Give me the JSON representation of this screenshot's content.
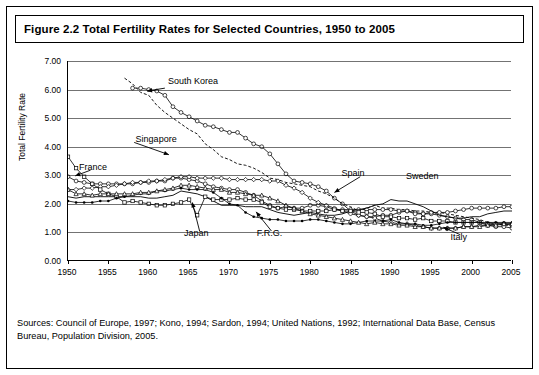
{
  "title": "Figure 2.2 Total Fertility Rates for Selected Countries, 1950 to 2005",
  "sources": "Sources: Council of Europe, 1997; Kono, 1994; Sardon, 1994; United Nations, 1992; International Data Base, Census Bureau, Population Division, 2005.",
  "chart_data": {
    "type": "line",
    "title": "Figure 2.2 Total Fertility Rates for Selected Countries, 1950 to 2005",
    "xlabel": "",
    "ylabel": "Total Fertility Rate",
    "xlim": [
      1950,
      2005
    ],
    "ylim": [
      0,
      7
    ],
    "grid": true,
    "legend_position": "inline-annotations",
    "yticks": [
      "0.00",
      "1.00",
      "2.00",
      "3.00",
      "4.00",
      "5.00",
      "6.00",
      "7.00"
    ],
    "ytick_values": [
      0,
      1,
      2,
      3,
      4,
      5,
      6,
      7
    ],
    "xticks": [
      "1950",
      "1955",
      "1960",
      "1965",
      "1970",
      "1975",
      "1980",
      "1985",
      "1990",
      "1995",
      "2000",
      "2005"
    ],
    "xtick_values": [
      1950,
      1955,
      1960,
      1965,
      1970,
      1975,
      1980,
      1985,
      1990,
      1995,
      2000,
      2005
    ],
    "annotations": [
      {
        "text": "South Korea",
        "x": 1962.5,
        "y": 6.25
      },
      {
        "text": "Singapore",
        "x": 1958.5,
        "y": 4.25
      },
      {
        "text": "France",
        "x": 1951.5,
        "y": 3.25
      },
      {
        "text": "Spain",
        "x": 1984.0,
        "y": 3.05
      },
      {
        "text": "Sweden",
        "x": 1992.0,
        "y": 2.95
      },
      {
        "text": "Japan",
        "x": 1964.5,
        "y": 0.95
      },
      {
        "text": "F.R.G.",
        "x": 1973.5,
        "y": 0.95
      },
      {
        "text": "Italy",
        "x": 1997.5,
        "y": 0.8
      }
    ],
    "series": [
      {
        "name": "South Korea",
        "x": [
          1958,
          1959,
          1960,
          1961,
          1962,
          1963,
          1964,
          1965,
          1966,
          1967,
          1968,
          1969,
          1970,
          1971,
          1972,
          1973,
          1974,
          1975,
          1976,
          1977,
          1978,
          1979,
          1980,
          1981,
          1982,
          1983,
          1984,
          1985,
          1986,
          1987,
          1988,
          1989,
          1990,
          1991,
          1992,
          1993,
          1994,
          1995,
          1996,
          1997,
          1998,
          1999,
          2000,
          2001,
          2002,
          2003,
          2004,
          2005
        ],
        "values": [
          6.05,
          6.05,
          6.0,
          5.95,
          5.8,
          5.4,
          5.2,
          5.05,
          4.9,
          4.75,
          4.7,
          4.6,
          4.5,
          4.5,
          4.3,
          4.1,
          4.0,
          3.75,
          3.4,
          3.05,
          2.8,
          2.75,
          2.7,
          2.6,
          2.45,
          2.2,
          2.0,
          1.75,
          1.6,
          1.55,
          1.55,
          1.6,
          1.6,
          1.7,
          1.75,
          1.7,
          1.65,
          1.65,
          1.6,
          1.55,
          1.5,
          1.45,
          1.45,
          1.35,
          1.25,
          1.2,
          1.2,
          1.15
        ]
      },
      {
        "name": "Singapore",
        "x": [
          1957,
          1958,
          1959,
          1960,
          1961,
          1962,
          1963,
          1964,
          1965,
          1966,
          1967,
          1968,
          1969,
          1970,
          1971,
          1972,
          1973,
          1974,
          1975,
          1976,
          1977,
          1978,
          1979,
          1980,
          1981,
          1982,
          1983,
          1984,
          1985,
          1986,
          1987,
          1988,
          1989,
          1990,
          1991,
          1992,
          1993,
          1994,
          1995,
          1996,
          1997,
          1998,
          1999,
          2000,
          2001,
          2002,
          2003,
          2004,
          2005
        ],
        "values": [
          6.4,
          6.2,
          5.9,
          5.8,
          5.45,
          5.2,
          5.0,
          4.8,
          4.6,
          4.45,
          4.1,
          3.9,
          3.65,
          3.55,
          3.4,
          3.35,
          3.25,
          3.1,
          2.9,
          2.85,
          2.75,
          2.7,
          2.65,
          2.6,
          2.45,
          2.35,
          2.2,
          2.0,
          1.9,
          1.75,
          1.85,
          1.95,
          1.85,
          1.85,
          1.8,
          1.8,
          1.75,
          1.75,
          1.7,
          1.7,
          1.65,
          1.6,
          1.55,
          1.5,
          1.45,
          1.35,
          1.3,
          1.25,
          1.25
        ]
      },
      {
        "name": "France",
        "x": [
          1950,
          1951,
          1952,
          1953,
          1954,
          1955,
          1956,
          1957,
          1958,
          1959,
          1960,
          1961,
          1962,
          1963,
          1964,
          1965,
          1966,
          1967,
          1968,
          1969,
          1970,
          1971,
          1972,
          1973,
          1974,
          1975,
          1976,
          1977,
          1978,
          1979,
          1980,
          1981,
          1982,
          1983,
          1984,
          1985,
          1986,
          1987,
          1988,
          1989,
          1990,
          1991,
          1992,
          1993,
          1994,
          1995,
          1996,
          1997,
          1998,
          1999,
          2000,
          2001,
          2002,
          2003,
          2004,
          2005
        ],
        "values": [
          2.95,
          2.8,
          2.75,
          2.7,
          2.7,
          2.7,
          2.7,
          2.7,
          2.7,
          2.75,
          2.75,
          2.8,
          2.8,
          2.9,
          2.9,
          2.85,
          2.8,
          2.7,
          2.6,
          2.55,
          2.5,
          2.5,
          2.4,
          2.3,
          2.1,
          1.95,
          1.85,
          1.9,
          1.85,
          1.85,
          1.95,
          1.95,
          1.9,
          1.8,
          1.8,
          1.8,
          1.8,
          1.8,
          1.8,
          1.8,
          1.8,
          1.75,
          1.75,
          1.65,
          1.65,
          1.7,
          1.7,
          1.7,
          1.75,
          1.8,
          1.85,
          1.85,
          1.85,
          1.85,
          1.9,
          1.9
        ]
      },
      {
        "name": "Sweden",
        "x": [
          1950,
          1951,
          1952,
          1953,
          1954,
          1955,
          1956,
          1957,
          1958,
          1959,
          1960,
          1961,
          1962,
          1963,
          1964,
          1965,
          1966,
          1967,
          1968,
          1969,
          1970,
          1971,
          1972,
          1973,
          1974,
          1975,
          1976,
          1977,
          1978,
          1979,
          1980,
          1981,
          1982,
          1983,
          1984,
          1985,
          1986,
          1987,
          1988,
          1989,
          1990,
          1991,
          1992,
          1993,
          1994,
          1995,
          1996,
          1997,
          1998,
          1999,
          2000,
          2001,
          2002,
          2003,
          2004,
          2005
        ],
        "values": [
          2.25,
          2.2,
          2.25,
          2.25,
          2.25,
          2.25,
          2.25,
          2.25,
          2.25,
          2.25,
          2.2,
          2.2,
          2.25,
          2.3,
          2.45,
          2.4,
          2.35,
          2.25,
          2.1,
          1.95,
          1.95,
          1.95,
          1.9,
          1.9,
          1.9,
          1.8,
          1.7,
          1.65,
          1.6,
          1.65,
          1.7,
          1.65,
          1.6,
          1.6,
          1.65,
          1.75,
          1.8,
          1.85,
          1.95,
          2.0,
          2.15,
          2.1,
          2.1,
          2.0,
          1.9,
          1.75,
          1.6,
          1.55,
          1.5,
          1.5,
          1.55,
          1.55,
          1.65,
          1.7,
          1.75,
          1.75
        ]
      },
      {
        "name": "Spain",
        "x": [
          1950,
          1951,
          1952,
          1953,
          1954,
          1955,
          1956,
          1957,
          1958,
          1959,
          1960,
          1961,
          1962,
          1963,
          1964,
          1965,
          1966,
          1967,
          1968,
          1969,
          1970,
          1971,
          1972,
          1973,
          1974,
          1975,
          1976,
          1977,
          1978,
          1979,
          1980,
          1981,
          1982,
          1983,
          1984,
          1985,
          1986,
          1987,
          1988,
          1989,
          1990,
          1991,
          1992,
          1993,
          1994,
          1995,
          1996,
          1997,
          1998,
          1999,
          2000,
          2001,
          2002,
          2003,
          2004,
          2005
        ],
        "values": [
          2.5,
          2.5,
          2.55,
          2.55,
          2.6,
          2.6,
          2.65,
          2.7,
          2.75,
          2.75,
          2.8,
          2.8,
          2.85,
          2.9,
          2.95,
          2.95,
          2.9,
          2.9,
          2.9,
          2.9,
          2.85,
          2.85,
          2.85,
          2.85,
          2.85,
          2.8,
          2.8,
          2.65,
          2.55,
          2.4,
          2.2,
          2.05,
          1.95,
          1.85,
          1.75,
          1.65,
          1.6,
          1.55,
          1.5,
          1.4,
          1.35,
          1.3,
          1.3,
          1.25,
          1.2,
          1.15,
          1.15,
          1.15,
          1.15,
          1.2,
          1.2,
          1.25,
          1.25,
          1.3,
          1.3,
          1.3
        ]
      },
      {
        "name": "Japan",
        "x": [
          1950,
          1951,
          1952,
          1953,
          1954,
          1955,
          1956,
          1957,
          1958,
          1959,
          1960,
          1961,
          1962,
          1963,
          1964,
          1965,
          1966,
          1967,
          1968,
          1969,
          1970,
          1971,
          1972,
          1973,
          1974,
          1975,
          1976,
          1977,
          1978,
          1979,
          1980,
          1981,
          1982,
          1983,
          1984,
          1985,
          1986,
          1987,
          1988,
          1989,
          1990,
          1991,
          1992,
          1993,
          1994,
          1995,
          1996,
          1997,
          1998,
          1999,
          2000,
          2001,
          2002,
          2003,
          2004,
          2005
        ],
        "values": [
          3.65,
          3.25,
          2.95,
          2.7,
          2.5,
          2.35,
          2.25,
          2.05,
          2.1,
          2.05,
          2.0,
          1.95,
          1.95,
          2.0,
          2.05,
          2.15,
          1.6,
          2.25,
          2.15,
          2.15,
          2.15,
          2.2,
          2.15,
          2.15,
          2.05,
          1.9,
          1.85,
          1.8,
          1.8,
          1.75,
          1.75,
          1.75,
          1.75,
          1.8,
          1.75,
          1.75,
          1.7,
          1.7,
          1.65,
          1.55,
          1.55,
          1.5,
          1.5,
          1.45,
          1.5,
          1.4,
          1.4,
          1.4,
          1.35,
          1.35,
          1.35,
          1.35,
          1.3,
          1.3,
          1.3,
          1.25
        ]
      },
      {
        "name": "F.R.G.",
        "x": [
          1950,
          1951,
          1952,
          1953,
          1954,
          1955,
          1956,
          1957,
          1958,
          1959,
          1960,
          1961,
          1962,
          1963,
          1964,
          1965,
          1966,
          1967,
          1968,
          1969,
          1970,
          1971,
          1972,
          1973,
          1974,
          1975,
          1976,
          1977,
          1978,
          1979,
          1980,
          1981,
          1982,
          1983,
          1984,
          1985,
          1986,
          1987,
          1988,
          1989,
          1990,
          1991,
          1992,
          1993,
          1994,
          1995,
          1996,
          1997,
          1998,
          1999,
          2000,
          2001,
          2002,
          2003,
          2004,
          2005
        ],
        "values": [
          2.1,
          2.05,
          2.05,
          2.05,
          2.1,
          2.1,
          2.2,
          2.25,
          2.3,
          2.35,
          2.35,
          2.45,
          2.45,
          2.5,
          2.55,
          2.5,
          2.5,
          2.5,
          2.4,
          2.2,
          2.0,
          1.95,
          1.7,
          1.55,
          1.5,
          1.45,
          1.45,
          1.4,
          1.4,
          1.4,
          1.45,
          1.45,
          1.4,
          1.35,
          1.3,
          1.3,
          1.35,
          1.4,
          1.4,
          1.4,
          1.45,
          1.35,
          1.3,
          1.3,
          1.25,
          1.25,
          1.3,
          1.35,
          1.35,
          1.35,
          1.35,
          1.35,
          1.35,
          1.35,
          1.35,
          1.35
        ]
      },
      {
        "name": "Italy",
        "x": [
          1950,
          1951,
          1952,
          1953,
          1954,
          1955,
          1956,
          1957,
          1958,
          1959,
          1960,
          1961,
          1962,
          1963,
          1964,
          1965,
          1966,
          1967,
          1968,
          1969,
          1970,
          1971,
          1972,
          1973,
          1974,
          1975,
          1976,
          1977,
          1978,
          1979,
          1980,
          1981,
          1982,
          1983,
          1984,
          1985,
          1986,
          1987,
          1988,
          1989,
          1990,
          1991,
          1992,
          1993,
          1994,
          1995,
          1996,
          1997,
          1998,
          1999,
          2000,
          2001,
          2002,
          2003,
          2004,
          2005
        ],
        "values": [
          2.5,
          2.35,
          2.35,
          2.3,
          2.35,
          2.35,
          2.35,
          2.35,
          2.35,
          2.4,
          2.4,
          2.45,
          2.5,
          2.55,
          2.65,
          2.65,
          2.6,
          2.55,
          2.5,
          2.5,
          2.4,
          2.4,
          2.35,
          2.3,
          2.3,
          2.2,
          2.1,
          1.95,
          1.85,
          1.75,
          1.65,
          1.6,
          1.55,
          1.5,
          1.45,
          1.4,
          1.35,
          1.3,
          1.35,
          1.3,
          1.3,
          1.25,
          1.25,
          1.2,
          1.2,
          1.15,
          1.15,
          1.15,
          1.15,
          1.2,
          1.2,
          1.2,
          1.25,
          1.25,
          1.3,
          1.3
        ]
      }
    ]
  }
}
